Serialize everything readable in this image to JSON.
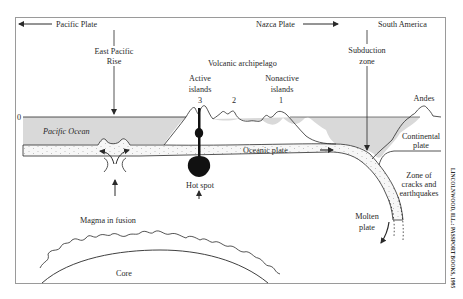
{
  "diagram": {
    "type": "cross-section",
    "frame": {
      "x": 15,
      "y": 17,
      "width": 430,
      "height": 267
    },
    "colors": {
      "ocean_fill": "#d9d9d9",
      "line": "#2a2a2a",
      "plate_fill": "#f7f7f7",
      "hotspot": "#111111",
      "background": "#ffffff"
    },
    "labels": {
      "pacific_plate": "Pacific Plate",
      "nazca_plate": "Nazca Plate",
      "south_america": "South America",
      "east_pacific_rise_1": "East Pacific",
      "east_pacific_rise_2": "Rise",
      "volcanic_archipelago": "Volcanic archipelago",
      "active_islands_1": "Active",
      "active_islands_2": "islands",
      "nonactive_islands_1": "Nonactive",
      "nonactive_islands_2": "islands",
      "island_3": "3",
      "island_2": "2",
      "island_1": "1",
      "subduction_zone_1": "Subduction",
      "subduction_zone_2": "zone",
      "andes": "Andes",
      "sea_level": "0",
      "pacific_ocean": "Pacific Ocean",
      "oceanic_plate": "Oceanic plate",
      "continental_plate_1": "Continental",
      "continental_plate_2": "plate",
      "hot_spot": "Hot spot",
      "zone_cracks_1": "Zone of",
      "zone_cracks_2": "cracks and",
      "zone_cracks_3": "earthquakes",
      "molten_plate_1": "Molten",
      "molten_plate_2": "plate",
      "magma_in_fusion": "Magma in fusion",
      "core": "Core"
    },
    "credit": "LINCOLNWOOD, ILL.: PASSPORT BOOKS, 1995"
  }
}
